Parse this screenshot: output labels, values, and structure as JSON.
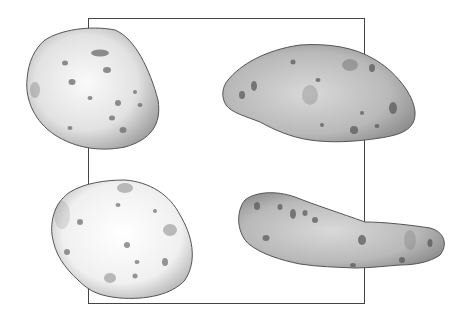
{
  "image": {
    "description": "Pencil illustration of four potatoes arranged around a rectangular frame",
    "style": "graphite pencil drawing, grayscale",
    "frame": {
      "left": 88,
      "top": 18,
      "right": 365,
      "bottom": 304,
      "color": "#444444"
    },
    "objects": [
      {
        "name": "potato-top-left",
        "shape": "round lumpy",
        "tone": "light with dark eyes"
      },
      {
        "name": "potato-top-right",
        "shape": "elongated oval",
        "tone": "mid-gray with dark eyes"
      },
      {
        "name": "potato-bottom-left",
        "shape": "round lumpy",
        "tone": "very light with dark eyes"
      },
      {
        "name": "potato-bottom-right",
        "shape": "long fingerling",
        "tone": "mid-gray with dark eyes"
      }
    ]
  }
}
